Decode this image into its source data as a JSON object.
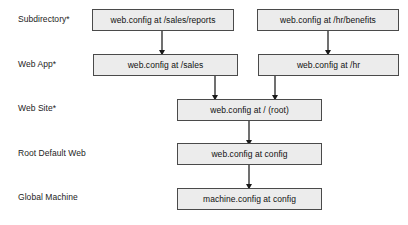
{
  "diagram": {
    "type": "hierarchy-flow",
    "background_color": "#ffffff",
    "box_fill_color": "#ececec",
    "box_border_color": "#4a4a4a",
    "arrow_color": "#1a1a1a"
  },
  "tiers": [
    {
      "label": "Subdirectory*"
    },
    {
      "label": "Web App*"
    },
    {
      "label": "Web Site*"
    },
    {
      "label": "Root Default Web"
    },
    {
      "label": "Global Machine"
    }
  ],
  "nodes": [
    {
      "id": "sales-reports",
      "label": "web.config at /sales/reports",
      "tier": "Subdirectory*"
    },
    {
      "id": "hr-benefits",
      "label": "web.config at /hr/benefits",
      "tier": "Subdirectory*"
    },
    {
      "id": "sales",
      "label": "web.config at /sales",
      "tier": "Web App*"
    },
    {
      "id": "hr",
      "label": "web.config at /hr",
      "tier": "Web App*"
    },
    {
      "id": "root",
      "label": "web.config at / (root)",
      "tier": "Web Site*"
    },
    {
      "id": "config",
      "label": "web.config at config",
      "tier": "Root Default Web"
    },
    {
      "id": "machine",
      "label": "machine.config at config",
      "tier": "Global Machine"
    }
  ],
  "edges": [
    {
      "from": "sales-reports",
      "to": "sales"
    },
    {
      "from": "hr-benefits",
      "to": "hr"
    },
    {
      "from": "sales",
      "to": "root"
    },
    {
      "from": "hr",
      "to": "root"
    },
    {
      "from": "root",
      "to": "config"
    },
    {
      "from": "config",
      "to": "machine"
    }
  ]
}
